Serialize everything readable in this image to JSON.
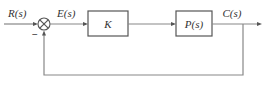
{
  "diagram": {
    "type": "feedback-control-block-diagram",
    "signals": {
      "input": "R(s)",
      "error": "E(s)",
      "output": "C(s)"
    },
    "blocks": [
      {
        "id": "controller",
        "label": "K"
      },
      {
        "id": "plant",
        "label": "P(s)"
      }
    ],
    "summing_junction": {
      "feedback_sign": "−"
    },
    "feedback": "unity negative feedback",
    "colors": {
      "line": "#888888",
      "box_border": "#555555",
      "text": "#333333",
      "background": "#ffffff"
    }
  }
}
